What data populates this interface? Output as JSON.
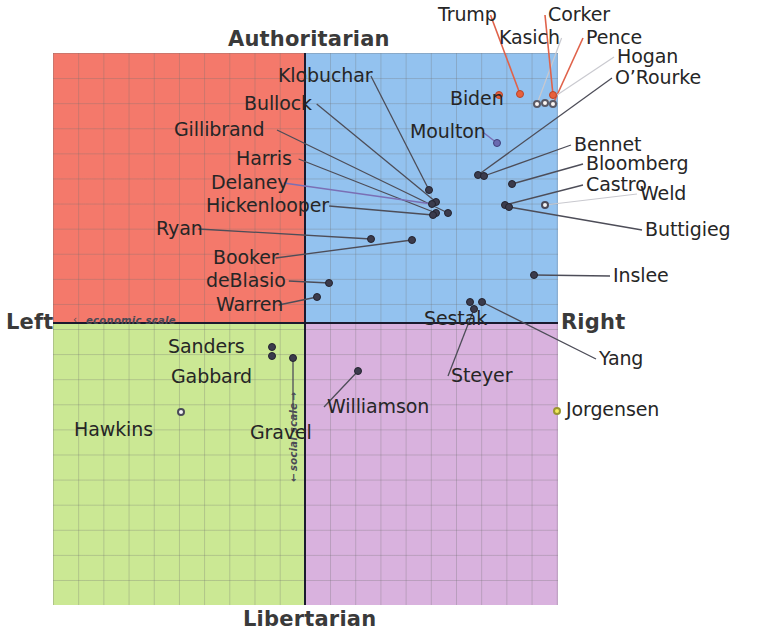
{
  "chart_data": {
    "type": "scatter",
    "xlabel": "economic scale",
    "ylabel": "social scale",
    "axis_labels": {
      "top": "Authoritarian",
      "bottom": "Libertarian",
      "left": "Left",
      "right": "Right",
      "x_scale": "economic scale",
      "y_scale": "social scale",
      "x_arrow_left": "‹",
      "x_arrow_right": "›"
    },
    "xlim": [
      -10,
      10
    ],
    "ylim": [
      -10,
      10
    ],
    "grid": true,
    "legend": "none",
    "quadrants": [
      {
        "name": "authoritarian-left",
        "color": "#f4796b"
      },
      {
        "name": "authoritarian-right",
        "color": "#93c2ef"
      },
      {
        "name": "libertarian-left",
        "color": "#cbe894"
      },
      {
        "name": "libertarian-right",
        "color": "#d9b2de"
      }
    ],
    "points": [
      {
        "name": "Trump",
        "px": 520,
        "py": 94,
        "x": 8.5,
        "y": 9.1,
        "marker": "trump",
        "label_x": 438,
        "label_y": 5,
        "leader": "red"
      },
      {
        "name": "Kasich",
        "px": 537,
        "py": 104,
        "x": 9.2,
        "y": 8.7,
        "marker": "hollow-r",
        "label_x": 499,
        "label_y": 28,
        "leader": "pale"
      },
      {
        "name": "Corker",
        "px": 553,
        "py": 95,
        "x": 9.8,
        "y": 9.1,
        "marker": "trump",
        "label_x": 548,
        "label_y": 5,
        "leader": "red"
      },
      {
        "name": "Pence",
        "px": 553,
        "py": 104,
        "x": 9.8,
        "y": 8.7,
        "marker": "hollow-r",
        "label_x": 586,
        "label_y": 28,
        "leader": "red"
      },
      {
        "name": "Hogan",
        "px": 545,
        "py": 103,
        "x": 9.5,
        "y": 8.8,
        "marker": "hollow-r",
        "label_x": 617,
        "label_y": 47,
        "leader": "pale"
      },
      {
        "name": "O’Rourke",
        "px": 478,
        "py": 175,
        "x": 6.8,
        "y": 5.9,
        "marker": "solid",
        "label_x": 615,
        "label_y": 68,
        "leader": "dark"
      },
      {
        "name": "Biden",
        "px": 499,
        "py": 95,
        "x": 7.6,
        "y": 9.1,
        "marker": "trump",
        "label_x": 450,
        "label_y": 89,
        "leader": "none"
      },
      {
        "name": "Moulton",
        "px": 497,
        "py": 143,
        "x": 7.5,
        "y": 7.1,
        "marker": "blue",
        "label_x": 410,
        "label_y": 122,
        "leader": "violet"
      },
      {
        "name": "Klobuchar",
        "px": 429,
        "py": 190,
        "x": 4.8,
        "y": 5.3,
        "marker": "solid",
        "label_x": 278,
        "label_y": 66,
        "leader": "dark"
      },
      {
        "name": "Bullock",
        "px": 436,
        "py": 202,
        "x": 5.1,
        "y": 4.8,
        "marker": "solid",
        "label_x": 244,
        "label_y": 94,
        "leader": "dark"
      },
      {
        "name": "Gillibrand",
        "px": 448,
        "py": 213,
        "x": 5.6,
        "y": 4.4,
        "marker": "solid",
        "label_x": 174,
        "label_y": 120,
        "leader": "dark"
      },
      {
        "name": "Harris",
        "px": 436,
        "py": 213,
        "x": 5.1,
        "y": 4.4,
        "marker": "solid",
        "label_x": 236,
        "label_y": 149,
        "leader": "dark"
      },
      {
        "name": "Delaney",
        "px": 432,
        "py": 204,
        "x": 5.0,
        "y": 4.7,
        "marker": "solid",
        "label_x": 211,
        "label_y": 173,
        "leader": "violet"
      },
      {
        "name": "Hickenlooper",
        "px": 433,
        "py": 215,
        "x": 5.0,
        "y": 4.3,
        "marker": "solid",
        "label_x": 206,
        "label_y": 196,
        "leader": "dark"
      },
      {
        "name": "Ryan",
        "px": 371,
        "py": 239,
        "x": 2.4,
        "y": 3.4,
        "marker": "solid",
        "label_x": 156,
        "label_y": 219,
        "leader": "dark"
      },
      {
        "name": "Booker",
        "px": 412,
        "py": 240,
        "x": 4.1,
        "y": 3.4,
        "marker": "solid",
        "label_x": 213,
        "label_y": 248,
        "leader": "dark"
      },
      {
        "name": "deBlasio",
        "px": 329,
        "py": 283,
        "x": 0.7,
        "y": 1.8,
        "marker": "solid",
        "label_x": 206,
        "label_y": 271,
        "leader": "dark"
      },
      {
        "name": "Warren",
        "px": 317,
        "py": 297,
        "x": 0.2,
        "y": 1.2,
        "marker": "solid",
        "label_x": 216,
        "label_y": 295,
        "leader": "dark"
      },
      {
        "name": "Bennet",
        "px": 484,
        "py": 176,
        "x": 7.0,
        "y": 5.8,
        "marker": "solid",
        "label_x": 574,
        "label_y": 135,
        "leader": "dark"
      },
      {
        "name": "Bloomberg",
        "px": 512,
        "py": 184,
        "x": 8.1,
        "y": 5.5,
        "marker": "solid",
        "label_x": 586,
        "label_y": 154,
        "leader": "dark"
      },
      {
        "name": "Castro",
        "px": 505,
        "py": 205,
        "x": 7.8,
        "y": 4.7,
        "marker": "solid",
        "label_x": 586,
        "label_y": 175,
        "leader": "dark"
      },
      {
        "name": "Weld",
        "px": 545,
        "py": 205,
        "x": 9.5,
        "y": 4.7,
        "marker": "hollow",
        "label_x": 640,
        "label_y": 184,
        "leader": "pale"
      },
      {
        "name": "Buttigieg",
        "px": 509,
        "py": 207,
        "x": 7.9,
        "y": 4.6,
        "marker": "solid",
        "label_x": 645,
        "label_y": 220,
        "leader": "dark"
      },
      {
        "name": "Inslee",
        "px": 534,
        "py": 275,
        "x": 8.9,
        "y": 2.1,
        "marker": "solid",
        "label_x": 613,
        "label_y": 266,
        "leader": "dark"
      },
      {
        "name": "Sestak",
        "px": 470,
        "py": 302,
        "x": 6.5,
        "y": 1.0,
        "marker": "solid",
        "label_x": 424,
        "label_y": 309,
        "leader": "none"
      },
      {
        "name": "Yang",
        "px": 482,
        "py": 302,
        "x": 7.0,
        "y": 1.0,
        "marker": "solid",
        "label_x": 599,
        "label_y": 349,
        "leader": "dark"
      },
      {
        "name": "Steyer",
        "px": 474,
        "py": 309,
        "x": 6.8,
        "y": 0.7,
        "marker": "solid",
        "label_x": 451,
        "label_y": 366,
        "leader": "dark"
      },
      {
        "name": "Sanders",
        "px": 272,
        "py": 347,
        "x": -1.5,
        "y": -0.9,
        "marker": "solid",
        "label_x": 168,
        "label_y": 337,
        "leader": "none"
      },
      {
        "name": "Gabbard",
        "px": 272,
        "py": 356,
        "x": -1.5,
        "y": -1.3,
        "marker": "solid",
        "label_x": 171,
        "label_y": 367,
        "leader": "none"
      },
      {
        "name": "Gravel",
        "px": 293,
        "py": 358,
        "x": -0.6,
        "y": -1.4,
        "marker": "solid",
        "label_x": 250,
        "label_y": 423,
        "leader": "vertical"
      },
      {
        "name": "Hawkins",
        "px": 181,
        "py": 412,
        "x": -5.0,
        "y": -3.5,
        "marker": "hollow",
        "label_x": 74,
        "label_y": 420,
        "leader": "none"
      },
      {
        "name": "Williamson",
        "px": 358,
        "py": 371,
        "x": 2.1,
        "y": -1.9,
        "marker": "solid",
        "label_x": 327,
        "label_y": 397,
        "leader": "dark"
      },
      {
        "name": "Jorgensen",
        "px": 557,
        "py": 411,
        "x": 10.0,
        "y": -3.5,
        "marker": "yellow",
        "label_x": 566,
        "label_y": 400,
        "leader": "none"
      }
    ]
  },
  "plot": {
    "left": 53,
    "top": 53,
    "width": 505,
    "height": 552,
    "origin_x": 252,
    "origin_y": 270,
    "grid_step_x": 25.2,
    "grid_step_y": 25.1
  }
}
